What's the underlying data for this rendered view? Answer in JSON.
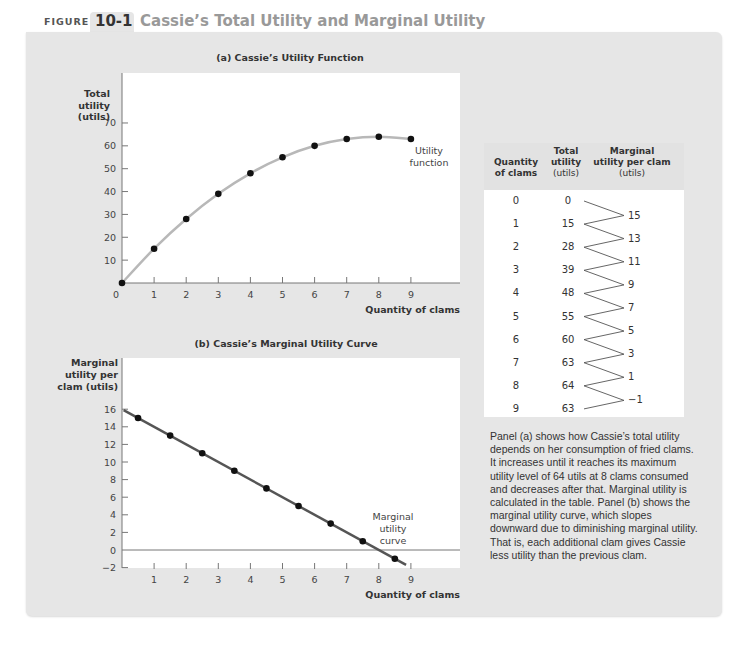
{
  "figure": {
    "label": "FIGURE",
    "number": "10-1",
    "title": "Cassie’s Total Utility and Marginal Utility"
  },
  "table": {
    "headers": {
      "quantity": [
        "Quantity",
        "of clams"
      ],
      "total": [
        "Total",
        "utility",
        "(utils)"
      ],
      "marginal": [
        "Marginal",
        "utility per clam",
        "(utils)"
      ]
    },
    "rows": [
      {
        "q": "0",
        "tu": "0"
      },
      {
        "q": "1",
        "tu": "15"
      },
      {
        "q": "2",
        "tu": "28"
      },
      {
        "q": "3",
        "tu": "39"
      },
      {
        "q": "4",
        "tu": "48"
      },
      {
        "q": "5",
        "tu": "55"
      },
      {
        "q": "6",
        "tu": "60"
      },
      {
        "q": "7",
        "tu": "63"
      },
      {
        "q": "8",
        "tu": "64"
      },
      {
        "q": "9",
        "tu": "63"
      }
    ],
    "marginal": [
      "15",
      "13",
      "11",
      "9",
      "7",
      "5",
      "3",
      "1",
      "−1"
    ]
  },
  "caption": "Panel (a) shows how Cassie’s total utility depends on her consumption of fried clams. It increases until it reaches its maximum utility level of 64 utils at 8 clams consumed and decreases after that. Marginal utility is calculated in the table. Panel (b) shows the marginal utility curve, which slopes downward due to diminishing marginal utility. That is, each additional clam gives Cassie less utility than the previous clam.",
  "colors": {
    "panel_bg": "#e6e6e6",
    "plot_bg": "#ffffff",
    "utility_curve": "#b8b8b8",
    "mu_curve": "#555555",
    "points": "#111111"
  },
  "chart_data": [
    {
      "type": "line",
      "title": "(a) Cassie’s Utility Function",
      "xlabel": "Quantity of clams",
      "ylabel": "Total utility (utils)",
      "x": [
        0,
        1,
        2,
        3,
        4,
        5,
        6,
        7,
        8,
        9
      ],
      "series": [
        {
          "name": "Utility function",
          "values": [
            0,
            15,
            28,
            39,
            48,
            55,
            60,
            63,
            64,
            63
          ]
        }
      ],
      "xticks": [
        "0",
        "1",
        "2",
        "3",
        "4",
        "5",
        "6",
        "7",
        "8",
        "9"
      ],
      "yticks": [
        "10",
        "20",
        "30",
        "40",
        "50",
        "60",
        "70"
      ],
      "xlim": [
        0,
        10.5
      ],
      "ylim": [
        0,
        90
      ],
      "annotation": "Utility function",
      "grid": false
    },
    {
      "type": "line",
      "title": "(b) Cassie’s Marginal Utility Curve",
      "xlabel": "Quantity of clams",
      "ylabel": "Marginal utility per clam (utils)",
      "x": [
        0.5,
        1.5,
        2.5,
        3.5,
        4.5,
        5.5,
        6.5,
        7.5,
        8.5
      ],
      "series": [
        {
          "name": "Marginal utility curve",
          "values": [
            15,
            13,
            11,
            9,
            7,
            5,
            3,
            1,
            -1
          ]
        }
      ],
      "xticks": [
        "1",
        "2",
        "3",
        "4",
        "5",
        "6",
        "7",
        "8",
        "9"
      ],
      "yticks": [
        "−2",
        "0",
        "2",
        "4",
        "6",
        "8",
        "10",
        "12",
        "14",
        "16"
      ],
      "xlim": [
        0,
        10.5
      ],
      "ylim": [
        -2,
        22
      ],
      "annotation": "Marginal utility curve",
      "grid": false
    }
  ]
}
